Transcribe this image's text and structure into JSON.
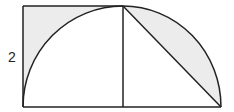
{
  "diagram": {
    "labels": {
      "side_length": "2"
    },
    "colors": {
      "stroke": "#222222",
      "shade": "#ececec",
      "background": "#ffffff"
    },
    "shapes": {
      "square": "left square of side 2",
      "quarter_arc_left": "quarter circle arc inside left square",
      "quarter_arc_right": "quarter circle arc on right",
      "vertical_divider": "vertical radius line",
      "chord": "diagonal chord of right quarter circle",
      "shaded_left": "region of square outside the arc",
      "shaded_right": "circular segment between arc and chord"
    }
  }
}
